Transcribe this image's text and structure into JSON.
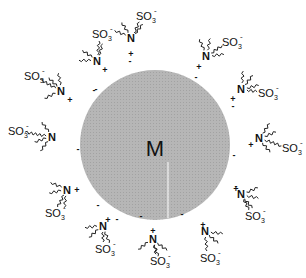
{
  "diagram": {
    "core": {
      "label": "M",
      "fill": "#b4b4b4",
      "cx": 155,
      "cy": 145,
      "r": 75
    },
    "counterion_charge": "-",
    "headgroup_label": "N",
    "headgroup_charge": "+",
    "anion_label": "SO",
    "anion_subscript": "3",
    "anion_charge": "-",
    "surfactants": [
      {
        "nx": 131,
        "ny": 42,
        "plus_dx": 0,
        "plus_dy": 12,
        "so3x": 136,
        "so3y": 20,
        "minus_x": 130,
        "minus_y": 64
      },
      {
        "nx": 97,
        "ny": 65,
        "plus_dx": 8,
        "plus_dy": 5,
        "so3x": 92,
        "so3y": 38,
        "minus_x": 96,
        "minus_y": 92
      },
      {
        "nx": 61,
        "ny": 95,
        "plus_dx": 9,
        "plus_dy": 5,
        "so3x": 24,
        "so3y": 80,
        "minus_x": 94,
        "minus_y": 93
      },
      {
        "nx": 52,
        "ny": 141,
        "plus_dx": 0,
        "plus_dy": 0,
        "so3x": 8,
        "so3y": 135,
        "minus_x": 78,
        "minus_y": 152
      },
      {
        "nx": 67,
        "ny": 194,
        "plus_dx": 10,
        "plus_dy": -4,
        "so3x": 45,
        "so3y": 217,
        "minus_x": 98,
        "minus_y": 208
      },
      {
        "nx": 103,
        "ny": 230,
        "plus_dx": 5,
        "plus_dy": -10,
        "so3x": 95,
        "so3y": 253,
        "minus_x": 117,
        "minus_y": 222
      },
      {
        "nx": 153,
        "ny": 243,
        "plus_dx": 0,
        "plus_dy": -12,
        "so3x": 150,
        "so3y": 265,
        "minus_x": 141,
        "minus_y": 219
      },
      {
        "nx": 205,
        "ny": 235,
        "plus_dx": -2,
        "plus_dy": -10,
        "so3x": 200,
        "so3y": 262,
        "minus_x": 182,
        "minus_y": 217
      },
      {
        "nx": 241,
        "ny": 198,
        "plus_dx": -5,
        "plus_dy": -9,
        "so3x": 245,
        "so3y": 220,
        "minus_x": 236,
        "minus_y": 189
      },
      {
        "nx": 259,
        "ny": 142,
        "plus_dx": -8,
        "plus_dy": 3,
        "so3x": 282,
        "so3y": 152,
        "minus_x": 234,
        "minus_y": 158
      },
      {
        "nx": 241,
        "ny": 93,
        "plus_dx": -8,
        "plus_dy": 6,
        "so3x": 258,
        "so3y": 97,
        "minus_x": 233,
        "minus_y": 109
      },
      {
        "nx": 206,
        "ny": 60,
        "plus_dx": -7,
        "plus_dy": 7,
        "so3x": 222,
        "so3y": 46,
        "minus_x": 196,
        "minus_y": 80
      }
    ]
  }
}
